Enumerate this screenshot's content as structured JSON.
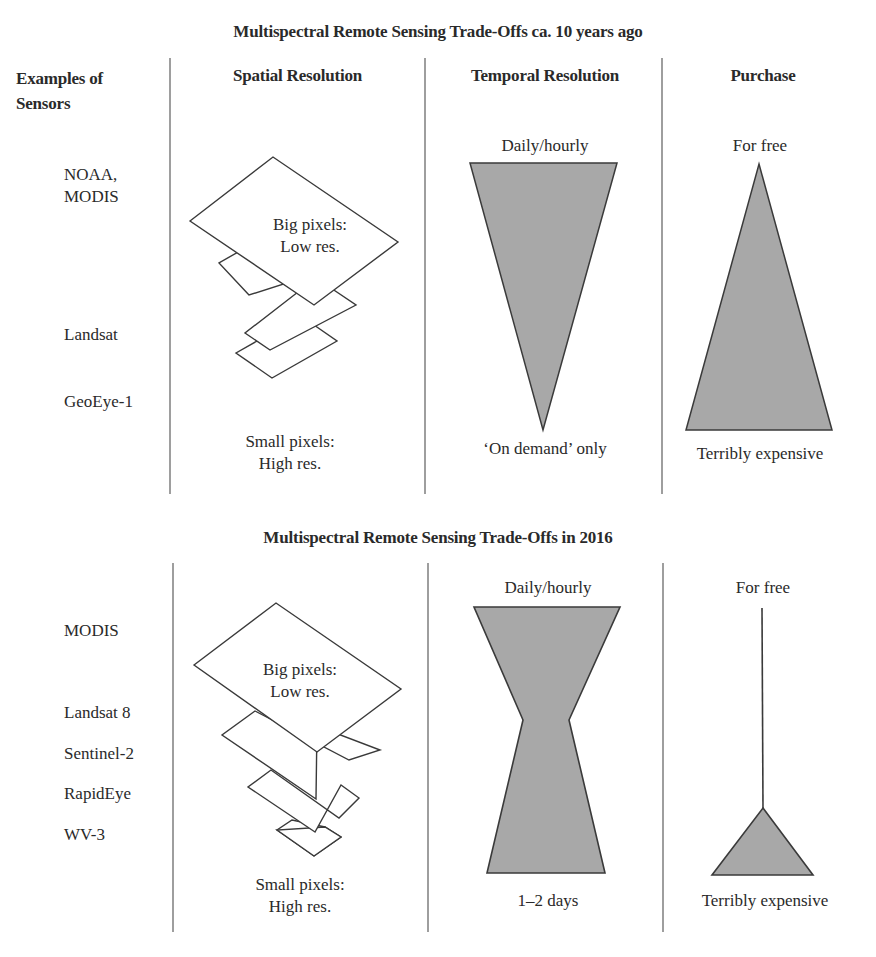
{
  "colors": {
    "fill": "#a8a8a8",
    "stroke": "#3a3a3a",
    "divider": "#6a6a6a",
    "text": "#2a2a2a"
  },
  "panels": [
    {
      "title": "Multispectral Remote Sensing Trade-Offs ca. 10 years ago",
      "column_headers": {
        "sensors": "Examples of Sensors",
        "spatial": "Spatial Resolution",
        "temporal": "Temporal Resolution",
        "purchase": "Purchase"
      },
      "sensors": [
        "NOAA, MODIS",
        "Landsat",
        "GeoEye-1"
      ],
      "spatial": {
        "top_label_1": "Big pixels:",
        "top_label_2": "Low res.",
        "bottom_label_1": "Small pixels:",
        "bottom_label_2": "High res."
      },
      "temporal": {
        "top_label": "Daily/hourly",
        "bottom_label": "‘On demand’ only",
        "shape": "inverted-triangle"
      },
      "purchase": {
        "top_label": "For free",
        "bottom_label": "Terribly expensive",
        "shape": "triangle"
      }
    },
    {
      "title": "Multispectral Remote Sensing Trade-Offs in 2016",
      "sensors": [
        "MODIS",
        "Landsat 8",
        "Sentinel-2",
        "RapidEye",
        "WV-3"
      ],
      "spatial": {
        "top_label_1": "Big pixels:",
        "top_label_2": "Low res.",
        "bottom_label_1": "Small pixels:",
        "bottom_label_2": "High res."
      },
      "temporal": {
        "top_label": "Daily/hourly",
        "bottom_label": "1–2 days",
        "shape": "hourglass"
      },
      "purchase": {
        "top_label": "For free",
        "bottom_label": "Terribly expensive",
        "shape": "line-with-small-triangle"
      }
    }
  ]
}
